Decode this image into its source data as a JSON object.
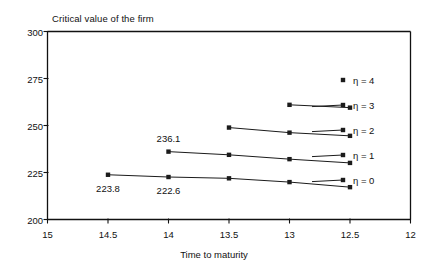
{
  "chart_data": {
    "type": "line",
    "title": "Critical value of the firm",
    "xlabel": "Time to maturity",
    "ylabel": "",
    "xlim": [
      15,
      12
    ],
    "ylim": [
      200,
      300
    ],
    "x_reversed": true,
    "grid": false,
    "legend_position": "right-inside",
    "xticks": [
      "15",
      "14.5",
      "14",
      "13.5",
      "13",
      "12.5",
      "12"
    ],
    "xtick_values": [
      15,
      14.5,
      14,
      13.5,
      13,
      12.5,
      12
    ],
    "yticks": [
      "200",
      "225",
      "250",
      "275",
      "300"
    ],
    "ytick_values": [
      200,
      225,
      250,
      275,
      300
    ],
    "series": [
      {
        "name": "η = 4",
        "legend_only": true,
        "x": [],
        "values": []
      },
      {
        "name": "η = 3",
        "legend_only": false,
        "x": [
          13,
          12.5
        ],
        "values": [
          261.0,
          259.5
        ]
      },
      {
        "name": "η = 2",
        "legend_only": false,
        "x": [
          13.5,
          13,
          12.5
        ],
        "values": [
          248.9,
          246.2,
          244.5
        ]
      },
      {
        "name": "η = 1",
        "legend_only": false,
        "x": [
          14,
          13.5,
          13,
          12.5
        ],
        "values": [
          236.1,
          234.4,
          232.1,
          230.1
        ]
      },
      {
        "name": "η = 0",
        "legend_only": false,
        "x": [
          14.5,
          14,
          13.5,
          13,
          12.5
        ],
        "values": [
          223.8,
          222.6,
          221.9,
          219.9,
          217.2
        ]
      }
    ],
    "annotations": [
      {
        "text": "236.1",
        "x": 14.0,
        "y": 236.1,
        "position": "above"
      },
      {
        "text": "223.8",
        "x": 14.5,
        "y": 223.8,
        "position": "below"
      },
      {
        "text": "222.6",
        "x": 14.0,
        "y": 222.6,
        "position": "below"
      }
    ],
    "colors": {
      "line": "#1b1b1b",
      "marker": "#1b1b1b",
      "axis": "#111111",
      "background": "#ffffff",
      "text": "#111111"
    }
  }
}
